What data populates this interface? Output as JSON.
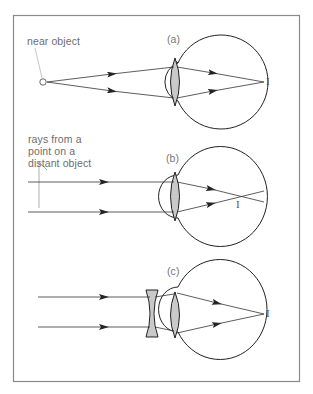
{
  "figure": {
    "frame": {
      "x": 13,
      "y": 15,
      "width": 286,
      "height": 366,
      "stroke": "#8a8a8a"
    },
    "colors": {
      "line": "#333333",
      "lens_fill": "#c9c9c9",
      "text": "#6e6e6e"
    }
  },
  "panels": [
    {
      "tag": "(a)",
      "caption_lines": [
        "near object"
      ],
      "object_marker": "O",
      "image_label": "I",
      "description": "near object rays converge through lens to image point on retina"
    },
    {
      "tag": "(b)",
      "caption_lines": [
        "rays from a",
        "point on a",
        "distant object"
      ],
      "image_label": "I",
      "description": "parallel rays focus in front of retina"
    },
    {
      "tag": "(c)",
      "caption_lines": [],
      "image_label": "I",
      "description": "diverging (concave) corrective lens placed before eye so rays focus on retina"
    }
  ]
}
